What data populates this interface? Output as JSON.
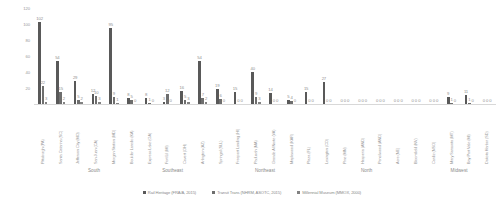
{
  "chart_data": {
    "type": "bar",
    "title": "",
    "xlabel": "",
    "ylabel": "",
    "ylim": [
      0,
      120
    ],
    "yticks": [
      0,
      20,
      40,
      60,
      80,
      100,
      120
    ],
    "grid": false,
    "legend_position": "bottom",
    "categories": [
      "Pittsburgh (PA)",
      "Santa Catarina (SC)",
      "Jefferson City (MO)",
      "San Juan (CA)",
      "Morgan Station (MD)",
      "Boulder Laredo (KA)",
      "Express Lake (GA)",
      "Fort Lil (MI)",
      "Covert (OH)",
      "Arlington (AZ)",
      "Springal (SLL)",
      "Freeport Landing (HI)",
      "Paducah (MA)",
      "Grande Al Norte (VA)",
      "Maplewood (KAR)",
      "Plaza (FL)",
      "Lexington (CO)",
      "Pine (MN)",
      "Hesperia (AND)",
      "Pencilwood (AND)",
      "Acre (NE)",
      "Bloomfield (NV)",
      "Cardiz (NSO)",
      "Mary Sarasota (MT)",
      "Bay Port Vale (MI)",
      "Dakota Harbor (SD)"
    ],
    "groups": [
      {
        "label": "South",
        "center_pct": 13
      },
      {
        "label": "Southeast",
        "center_pct": 30
      },
      {
        "label": "Northeast",
        "center_pct": 50
      },
      {
        "label": "North",
        "center_pct": 72
      },
      {
        "label": "Midwest",
        "center_pct": 92
      }
    ],
    "series": [
      {
        "name": "Rail Heritage (FRA/A, 2015)",
        "color": "#595959",
        "values": [
          102,
          54,
          29,
          12,
          95,
          8,
          8,
          3,
          16,
          54,
          19,
          15,
          40,
          14,
          5,
          15,
          27,
          0,
          0,
          0,
          0,
          0,
          0,
          9,
          11,
          0
        ]
      },
      {
        "name": "Transit Trans (NHRM, ASOTC, 2015)",
        "color": "#6e6e6e",
        "values": [
          22,
          15,
          5,
          10,
          9,
          5,
          1,
          12,
          5,
          7,
          6,
          0,
          9,
          0,
          4,
          0,
          0,
          0,
          0,
          0,
          0,
          0,
          0,
          1,
          1,
          0
        ]
      },
      {
        "name": "Millennial Museum (MMOX, 2000)",
        "color": "#828282",
        "values": [
          3,
          2,
          2,
          3,
          1,
          0,
          0,
          0,
          3,
          2,
          0,
          0,
          3,
          0,
          0,
          0,
          0,
          0,
          0,
          0,
          0,
          0,
          0,
          0,
          0,
          0
        ]
      }
    ]
  },
  "legend": {
    "items": [
      "Rail Heritage (FRA/A, 2015)",
      "Transit Trans (NHRM, ASOTC, 2015)",
      "Millennial Museum (MMOX, 2000)"
    ]
  }
}
